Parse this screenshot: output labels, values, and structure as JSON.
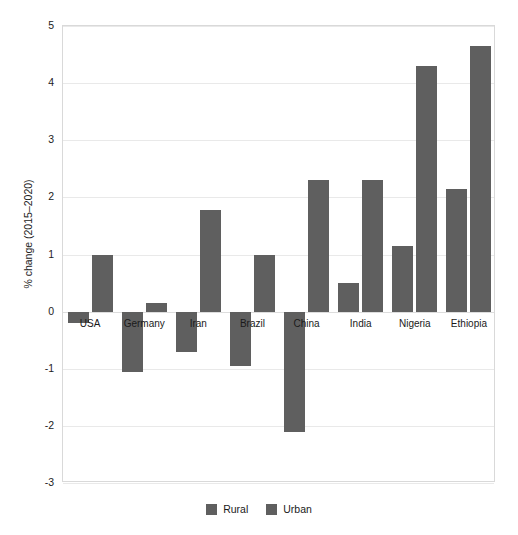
{
  "chart_data": {
    "type": "bar",
    "title": "",
    "xlabel": "",
    "ylabel": "% change (2015–2020)",
    "ylim": [
      -3,
      5
    ],
    "yticks": [
      5,
      4,
      3,
      2,
      1,
      0,
      -1,
      -2,
      -3
    ],
    "ytick_labels": [
      "5",
      "4",
      "3",
      "2",
      "1",
      "0",
      "-1",
      "-2",
      "-3"
    ],
    "grid": true,
    "legend_position": "bottom",
    "categories": [
      "USA",
      "Germany",
      "Iran",
      "Brazil",
      "China",
      "India",
      "Nigeria",
      "Ethiopia"
    ],
    "series": [
      {
        "name": "Rural",
        "color": "#5f5f5f",
        "values": [
          -0.2,
          -1.05,
          -0.7,
          -0.95,
          -2.1,
          0.5,
          1.15,
          2.15
        ]
      },
      {
        "name": "Urban",
        "color": "#5f5f5f",
        "values": [
          1.0,
          0.15,
          1.78,
          1.0,
          2.3,
          2.3,
          4.3,
          4.65
        ]
      }
    ]
  },
  "legend": {
    "items": [
      {
        "label": "Rural",
        "color": "#5f5f5f"
      },
      {
        "label": "Urban",
        "color": "#5f5f5f"
      }
    ]
  },
  "colors": {
    "bar": "#5f5f5f",
    "grid": "#e9e9e9",
    "frame": "#d9d9d9",
    "text": "#1a1a1a",
    "background": "#ffffff"
  }
}
